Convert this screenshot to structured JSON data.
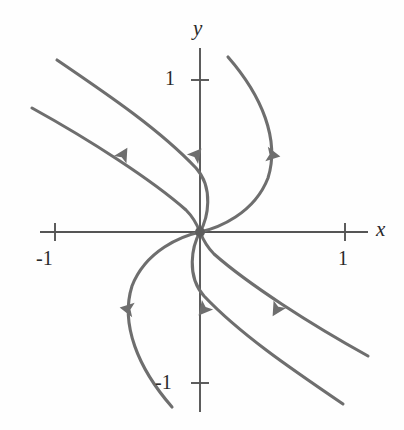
{
  "figure": {
    "kind": "phase-portrait",
    "background_color": "#fefefe",
    "curve_color": "#6e6e6e",
    "axis_color": "#555555",
    "text_color": "#2a2a2a",
    "curve_width": 3.1,
    "axis_width": 1.9
  },
  "axes": {
    "x_axis": {
      "label": "x",
      "label_x": 376,
      "label_y": 219,
      "line": {
        "x1": 40,
        "y1": 232,
        "x2": 368,
        "y2": 232
      },
      "ticks": [
        {
          "value": "-1",
          "x": 55,
          "label_x": 36,
          "label_y": 248
        },
        {
          "value": "1",
          "x": 345,
          "label_x": 338,
          "label_y": 248
        }
      ],
      "tick_half_length": 9
    },
    "y_axis": {
      "label": "y",
      "label_x": 193,
      "label_y": 18,
      "line": {
        "x1": 200,
        "y1": 48,
        "x2": 200,
        "y2": 412
      },
      "ticks": [
        {
          "value": "1",
          "y": 80,
          "label_x": 165,
          "label_y": 68
        },
        {
          "value": "-1",
          "y": 383,
          "label_x": 155,
          "label_y": 372
        }
      ],
      "tick_half_length": 9
    },
    "origin": {
      "x": 200,
      "y": 232
    },
    "unit_px_x": 145,
    "unit_px_y": 152
  },
  "equilibrium_point": {
    "name": "origin-node",
    "x": 200,
    "y": 232,
    "radius": 5,
    "color": "#5d5d5d"
  },
  "chart_data": {
    "type": "line",
    "title": "",
    "xlabel": "x",
    "ylabel": "y",
    "xlim": [
      -1.1,
      1.16
    ],
    "ylim": [
      -1.21,
      1.21
    ],
    "grid": false,
    "legend": false,
    "xticks": [
      -1,
      1
    ],
    "xticklabels": [
      "-1",
      "1"
    ],
    "yticks": [
      -1,
      1
    ],
    "yticklabels": [
      "1",
      "-1"
    ],
    "annotations": [
      "All six trajectories approach the origin tangent to a common direction (degenerate node).",
      "The portrait has 180-degree rotational symmetry about the origin."
    ],
    "series": [
      {
        "name": "trajectory-upper-left-outer",
        "direction": "toward-origin",
        "path": "M 57 60 C 110 96, 160 130, 196 168 C 214 188, 208 218, 200 232",
        "arrow": {
          "x": 196,
          "y": 155,
          "angle_deg": 40
        }
      },
      {
        "name": "trajectory-upper-left-inner",
        "direction": "toward-origin",
        "path": "M 32 108 C 90 140, 152 180, 186 210 C 194 218, 198 227, 200 232",
        "arrow": {
          "x": 123,
          "y": 155,
          "angle_deg": 31
        }
      },
      {
        "name": "trajectory-upper-right",
        "direction": "toward-origin",
        "path": "M 228 57 C 262 96, 280 140, 268 178 C 254 214, 218 228, 200 232",
        "arrow": {
          "x": 272,
          "y": 155,
          "angle_deg": 100
        }
      },
      {
        "name": "trajectory-lower-right-outer",
        "direction": "toward-origin",
        "path": "M 343 404 C 290 368, 240 334, 204 296 C 186 276, 192 246, 200 232",
        "arrow": {
          "x": 204,
          "y": 309,
          "angle_deg": 220
        }
      },
      {
        "name": "trajectory-lower-right-inner",
        "direction": "toward-origin",
        "path": "M 368 356 C 310 324, 248 284, 214 254 C 206 246, 202 237, 200 232",
        "arrow": {
          "x": 277,
          "y": 309,
          "angle_deg": 211
        }
      },
      {
        "name": "trajectory-lower-left",
        "direction": "toward-origin",
        "path": "M 172 407 C 138 368, 120 324, 132 286 C 146 250, 182 236, 200 232",
        "arrow": {
          "x": 128,
          "y": 309,
          "angle_deg": 280
        }
      }
    ]
  }
}
